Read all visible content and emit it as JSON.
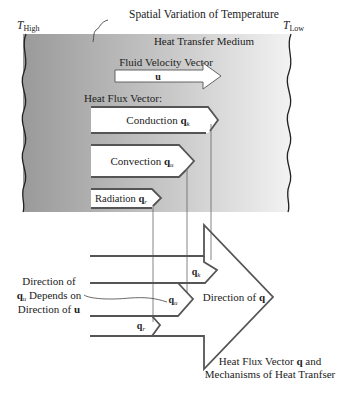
{
  "title": "Spatial Variation of Temperature",
  "left_temperature": {
    "symbol": "T",
    "subscript": "High"
  },
  "right_temperature": {
    "symbol": "T",
    "subscript": "Low"
  },
  "medium_label": "Heat Transfer Medium",
  "velocity": {
    "label": "Fluid Velocity Vector",
    "symbol": "u"
  },
  "heat_flux_label": "Heat Flux Vector:",
  "mechanisms": [
    {
      "name": "Conduction",
      "symbol": "q",
      "subscript": "k"
    },
    {
      "name": "Convection",
      "symbol": "q",
      "subscript": "u"
    },
    {
      "name": "Radiation",
      "symbol": "q",
      "subscript": "r"
    }
  ],
  "composite": {
    "direction_label": "Direction of",
    "direction_symbol": "q",
    "components": [
      {
        "symbol": "q",
        "subscript": "k"
      },
      {
        "symbol": "q",
        "subscript": "u"
      },
      {
        "symbol": "q",
        "subscript": "r"
      }
    ]
  },
  "note": {
    "line1": "Direction of",
    "line2_symbol": "q",
    "line2_subscript": "u",
    "line2_text": " Depends on",
    "line3_text": "Direction of ",
    "line3_symbol": "u"
  },
  "caption": {
    "line1_text": "Heat Flux Vector ",
    "line1_symbol": "q",
    "line1_after": " and",
    "line2": "Mechanisms of Heat Tranfser"
  },
  "colors": {
    "gradient_left": "#9a9a9a",
    "gradient_right": "#f2f2f2",
    "stroke": "#4a4a4a"
  }
}
